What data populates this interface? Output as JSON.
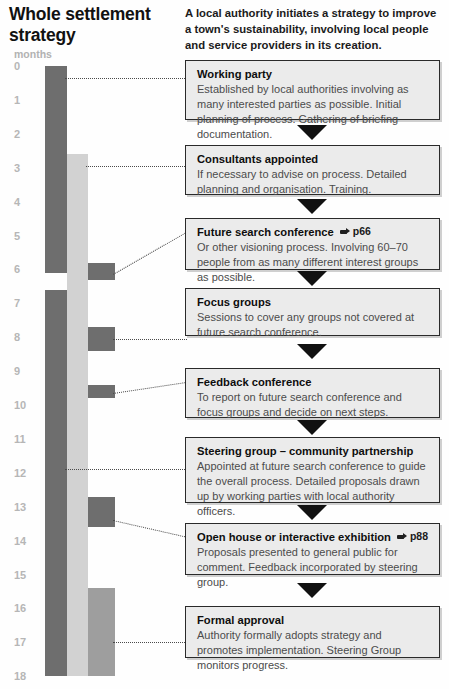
{
  "title": "Whole settlement strategy",
  "intro": "A local authority initiates a strategy to improve a town's sustainability, involving local people and service providers in its creation.",
  "timeline": {
    "axis_label": "months",
    "ticks": [
      "0",
      "1",
      "2",
      "3",
      "4",
      "5",
      "6",
      "7",
      "8",
      "9",
      "10",
      "11",
      "12",
      "13",
      "14",
      "15",
      "16",
      "17",
      "18"
    ]
  },
  "chart_data": {
    "type": "bar",
    "title": "Whole settlement strategy",
    "xlabel": "",
    "ylabel": "months",
    "ylim": [
      0,
      18
    ],
    "grid": false,
    "legend": "none",
    "orientation": "vertical-timeline",
    "categories": [
      "Working party",
      "Consultants appointed",
      "Future search conference",
      "Focus groups",
      "Feedback conference",
      "Steering group – community partnership",
      "Open house or interactive exhibition",
      "Formal approval"
    ],
    "tick_labels": [
      "0",
      "1",
      "2",
      "3",
      "4",
      "5",
      "6",
      "7",
      "8",
      "9",
      "10",
      "11",
      "12",
      "13",
      "14",
      "15",
      "16",
      "17",
      "18"
    ],
    "bars": [
      {
        "name": "working-party-bar",
        "track": 1,
        "start_month": 0.0,
        "end_month": 6.1,
        "color": "#6e6e6e"
      },
      {
        "name": "steering-group-bar",
        "track": 1,
        "start_month": 6.6,
        "end_month": 18.0,
        "color": "#6e6e6e"
      },
      {
        "name": "consultants-bar",
        "track": 2,
        "start_month": 2.6,
        "end_month": 18.0,
        "color": "#d2d2d2"
      },
      {
        "name": "future-search-block",
        "track": 3,
        "start_month": 5.8,
        "end_month": 6.3,
        "color": "#6e6e6e"
      },
      {
        "name": "focus-groups-block",
        "track": 3,
        "start_month": 7.7,
        "end_month": 8.4,
        "color": "#6e6e6e"
      },
      {
        "name": "feedback-block",
        "track": 3,
        "start_month": 9.4,
        "end_month": 9.8,
        "color": "#6e6e6e"
      },
      {
        "name": "open-house-block",
        "track": 3,
        "start_month": 12.7,
        "end_month": 13.6,
        "color": "#6e6e6e"
      },
      {
        "name": "formal-approval-bar",
        "track": 3,
        "start_month": 15.4,
        "end_month": 18.0,
        "color": "#9e9e9e"
      }
    ],
    "values": [
      6.1,
      15.4,
      0.5,
      0.7,
      0.4,
      11.4,
      0.9,
      2.6
    ]
  },
  "steps": [
    {
      "heading": "Working party",
      "xref": null,
      "body": "Established by local authorities involving as many interested parties as possible. Initial planning of process. Gathering of briefing documentation."
    },
    {
      "heading": "Consultants appointed",
      "xref": null,
      "body": "If necessary to advise on process. Detailed planning and organisation. Training."
    },
    {
      "heading": "Future search conference",
      "xref": "p66",
      "body": "Or other visioning process. Involving 60–70 people from as many different interest groups as possible."
    },
    {
      "heading": "Focus groups",
      "xref": null,
      "body": "Sessions to cover any groups not covered at future search conference."
    },
    {
      "heading": "Feedback conference",
      "xref": null,
      "body": "To report on future search conference and focus groups and decide on next steps."
    },
    {
      "heading": "Steering group – community partnership",
      "xref": null,
      "body": "Appointed at future search conference to guide the overall process. Detailed proposals drawn up by working parties with local authority officers."
    },
    {
      "heading": "Open house or interactive exhibition",
      "xref": "p88",
      "body": "Proposals presented to general public for comment. Feedback incorporated by steering group."
    },
    {
      "heading": "Formal approval",
      "xref": null,
      "body": "Authority formally adopts strategy and promotes implementation. Steering Group monitors progress."
    }
  ],
  "colors": {
    "bar_dark": "#6e6e6e",
    "bar_light": "#d2d2d2",
    "bar_mid": "#9e9e9e",
    "box_fill": "#ebebeb",
    "box_border": "#2a2a2a",
    "tick_text": "#b6b6b6"
  }
}
